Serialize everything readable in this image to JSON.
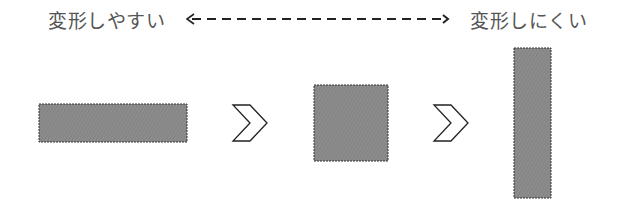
{
  "scale": {
    "left_label": "変形しやすい",
    "right_label": "変形しにくい",
    "arrow": "bidirectional-dashed"
  },
  "shapes": [
    {
      "name": "wide-rectangle",
      "x": 39,
      "y": 104,
      "w": 148,
      "h": 38
    },
    {
      "name": "square",
      "x": 314,
      "y": 85,
      "w": 74,
      "h": 76
    },
    {
      "name": "tall-rectangle",
      "x": 514,
      "y": 48,
      "w": 37,
      "h": 150
    }
  ],
  "colors": {
    "fill": "#8a8a8a",
    "stroke": "#333333",
    "text": "#555555"
  }
}
